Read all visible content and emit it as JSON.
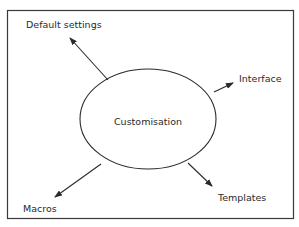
{
  "diagram": {
    "center": {
      "label": "Customisation"
    },
    "nodes": [
      {
        "id": "default-settings",
        "label": "Default settings"
      },
      {
        "id": "interface",
        "label": "Interface"
      },
      {
        "id": "macros",
        "label": "Macros"
      },
      {
        "id": "templates",
        "label": "Templates"
      }
    ],
    "colors": {
      "stroke": "#2a2a2a",
      "frame": "#3a3a3a",
      "background": "#ffffff"
    }
  }
}
